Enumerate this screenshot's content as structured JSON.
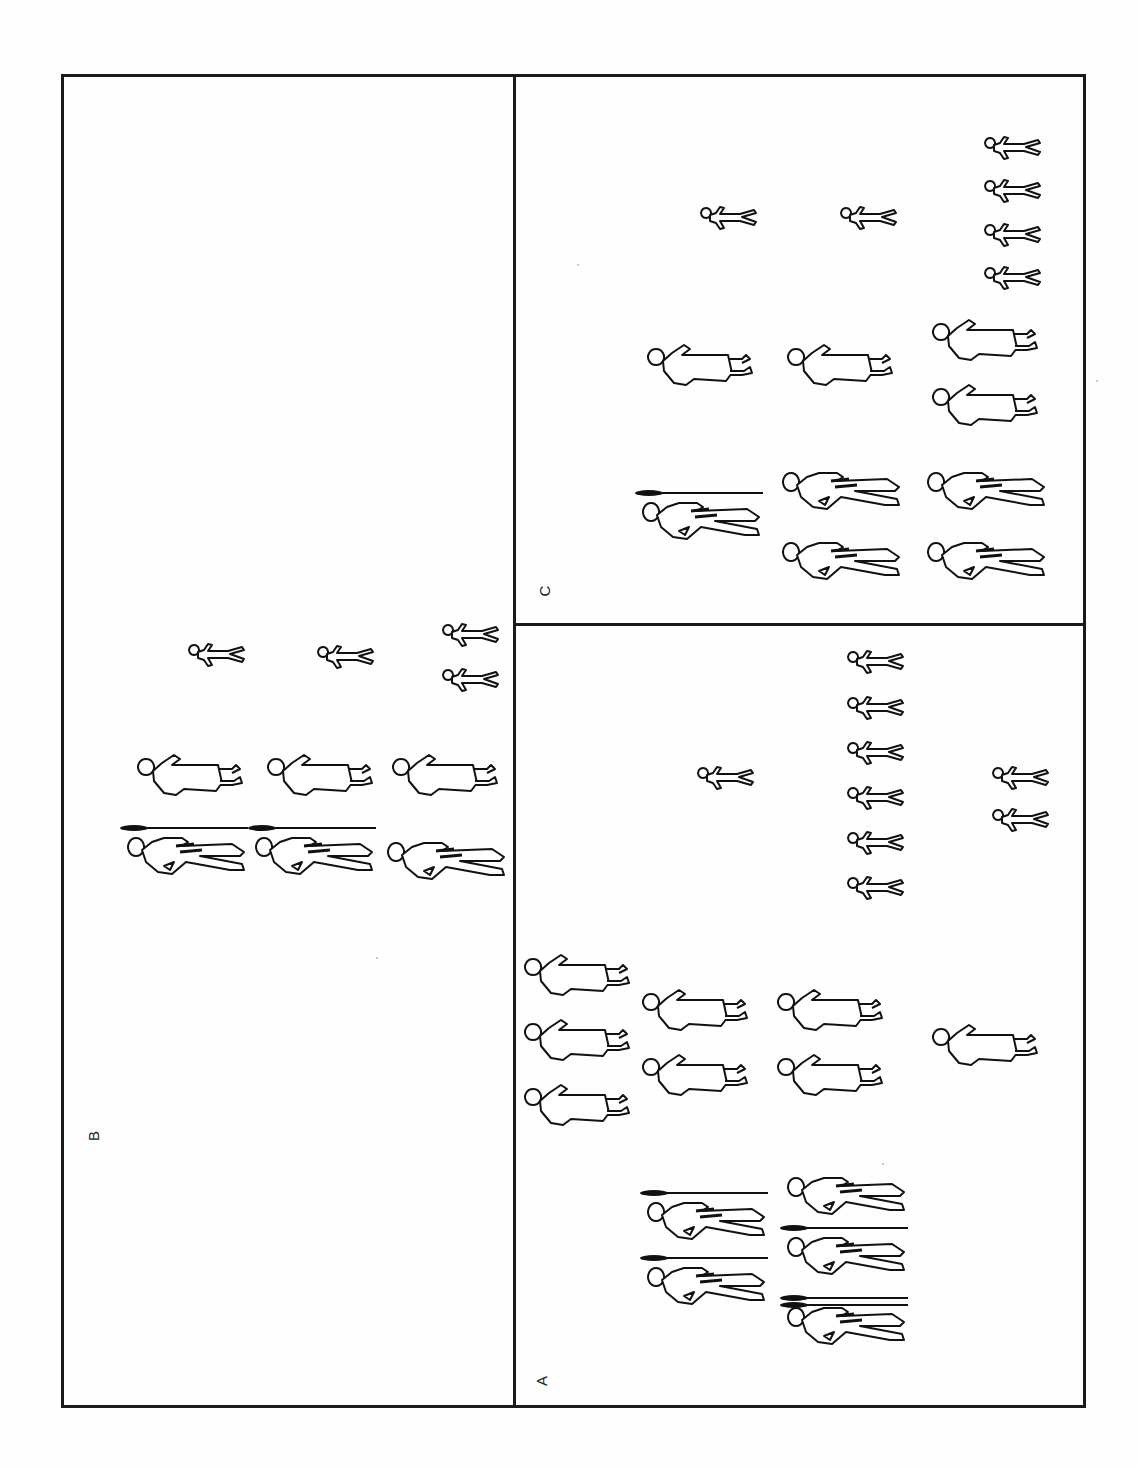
{
  "figure": {
    "panels": [
      {
        "id": "B",
        "label": "B"
      },
      {
        "id": "A",
        "label": "A"
      },
      {
        "id": "C",
        "label": "C"
      }
    ],
    "legend_semantics": {
      "warrior": "armed male figure (some carrying spears)",
      "woman": "figure in dress",
      "child": "small figure"
    },
    "panel_B": {
      "children": [
        [
          216,
          655
        ],
        [
          345,
          657
        ],
        [
          470,
          635
        ],
        [
          470,
          680
        ]
      ],
      "women": [
        [
          190,
          775
        ],
        [
          320,
          775
        ],
        [
          445,
          775
        ]
      ],
      "warriors": [
        {
          "pos": [
            185,
            850
          ],
          "spears": 1
        },
        {
          "pos": [
            313,
            850
          ],
          "spears": 1
        },
        {
          "pos": [
            445,
            855
          ],
          "spears": 0
        }
      ]
    },
    "panel_C": {
      "children": [
        [
          728,
          218
        ],
        [
          868,
          218
        ],
        [
          1012,
          148
        ],
        [
          1012,
          191
        ],
        [
          1012,
          235
        ],
        [
          1012,
          278
        ]
      ],
      "women": [
        [
          700,
          365
        ],
        [
          840,
          365
        ],
        [
          985,
          340
        ],
        [
          985,
          405
        ]
      ],
      "warriors": [
        {
          "pos": [
            700,
            515
          ],
          "spears": 1
        },
        {
          "pos": [
            840,
            485
          ],
          "spears": 0
        },
        {
          "pos": [
            840,
            555
          ],
          "spears": 0
        },
        {
          "pos": [
            985,
            485
          ],
          "spears": 0
        },
        {
          "pos": [
            985,
            555
          ],
          "spears": 0
        }
      ]
    },
    "panel_A": {
      "children": [
        [
          725,
          778
        ],
        [
          875,
          662
        ],
        [
          875,
          708
        ],
        [
          875,
          753
        ],
        [
          875,
          798
        ],
        [
          875,
          843
        ],
        [
          875,
          888
        ],
        [
          1020,
          778
        ],
        [
          1020,
          820
        ]
      ],
      "women": [
        [
          577,
          975
        ],
        [
          577,
          1040
        ],
        [
          577,
          1105
        ],
        [
          695,
          1010
        ],
        [
          695,
          1075
        ],
        [
          830,
          1010
        ],
        [
          830,
          1075
        ],
        [
          985,
          1045
        ]
      ],
      "warriors": [
        {
          "pos": [
            705,
            1215
          ],
          "spears": 1
        },
        {
          "pos": [
            705,
            1280
          ],
          "spears": 1
        },
        {
          "pos": [
            845,
            1190
          ],
          "spears": 0
        },
        {
          "pos": [
            845,
            1250
          ],
          "spears": 1
        },
        {
          "pos": [
            845,
            1320
          ],
          "spears": 2
        }
      ]
    }
  }
}
